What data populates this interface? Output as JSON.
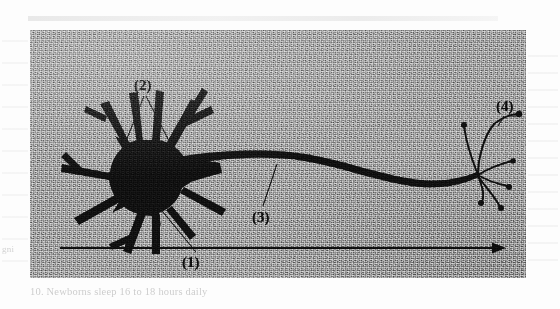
{
  "figure": {
    "type": "neuron-diagram",
    "background_color": "#9d9d9d",
    "ink_color": "#101010",
    "page_color": "#fdfdfd",
    "panel": {
      "x": 30,
      "y": 30,
      "width": 496,
      "height": 248
    },
    "labels": [
      {
        "id": "1",
        "text": "(1)",
        "x": 152,
        "y": 225,
        "refers_to": "cell body (soma)",
        "leader_from": [
          168,
          222
        ],
        "leader_to": [
          128,
          176
        ]
      },
      {
        "id": "2",
        "text": "(2)",
        "x": 104,
        "y": 48,
        "refers_to": "dendrites",
        "leader_from": [
          114,
          66
        ],
        "leader_to": [
          92,
          120
        ]
      },
      {
        "id": "3",
        "text": "(3)",
        "x": 222,
        "y": 180,
        "refers_to": "axon",
        "leader_from": [
          232,
          176
        ],
        "leader_to": [
          247,
          136
        ]
      },
      {
        "id": "4",
        "text": "(4)",
        "x": 466,
        "y": 69,
        "refers_to": "axon terminals",
        "leader_from": [
          474,
          86
        ],
        "leader_to": [
          466,
          120
        ]
      }
    ],
    "arrow": {
      "label": "Direction of information flow",
      "x_start": 60,
      "x_end": 500,
      "y": 248,
      "direction": "left-to-right"
    },
    "caption": "Direction of information flow",
    "parts": {
      "soma": {
        "cx": 122,
        "cy": 148,
        "rx": 38,
        "ry": 38
      },
      "dendrite_count": 11,
      "axon": {
        "x_start": 160,
        "x_end": 452,
        "y_start": 138,
        "y_end": 152
      },
      "terminal_count": 7
    }
  },
  "ghost_text": {
    "bottom_line": "10.  Newborns sleep 16 to 18 hours daily",
    "left_margin": "gni",
    "right_margin": ""
  }
}
